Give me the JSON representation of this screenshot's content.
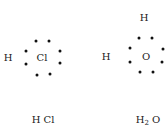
{
  "molecules": [
    {
      "name": "hcl-structure",
      "center": {
        "symbol": "Cl",
        "x": 41,
        "y": 58
      },
      "atoms": [
        {
          "symbol": "H",
          "x": 8,
          "y": 58
        }
      ],
      "dots": [
        [
          36,
          41
        ],
        [
          49,
          41
        ],
        [
          26,
          51
        ],
        [
          26,
          64
        ],
        [
          60,
          51
        ],
        [
          60,
          63
        ],
        [
          37,
          75
        ],
        [
          50,
          74
        ]
      ],
      "caption": {
        "prefix": "H",
        "sub": "",
        "suffix": " Cl",
        "x": 43,
        "y": 120
      }
    },
    {
      "name": "h2o-structure",
      "center": {
        "symbol": "O",
        "x": 146,
        "y": 57
      },
      "atoms": [
        {
          "symbol": "H",
          "x": 106,
          "y": 57
        },
        {
          "symbol": "H",
          "x": 144,
          "y": 18
        }
      ],
      "dots": [
        [
          139,
          38
        ],
        [
          152,
          38
        ],
        [
          130,
          48
        ],
        [
          130,
          62
        ],
        [
          163,
          49
        ],
        [
          162,
          62
        ],
        [
          140,
          72
        ],
        [
          153,
          72
        ]
      ],
      "caption": {
        "prefix": "H",
        "sub": "2",
        "suffix": " O",
        "x": 148,
        "y": 120
      }
    }
  ],
  "captions": {
    "hcl": "H Cl",
    "h2o_h": "H",
    "h2o_sub": "2",
    "h2o_o": " O"
  },
  "symbols": {
    "hcl_h": "H",
    "hcl_cl": "Cl",
    "h2o_h_left": "H",
    "h2o_h_top": "H",
    "h2o_o": "O"
  }
}
